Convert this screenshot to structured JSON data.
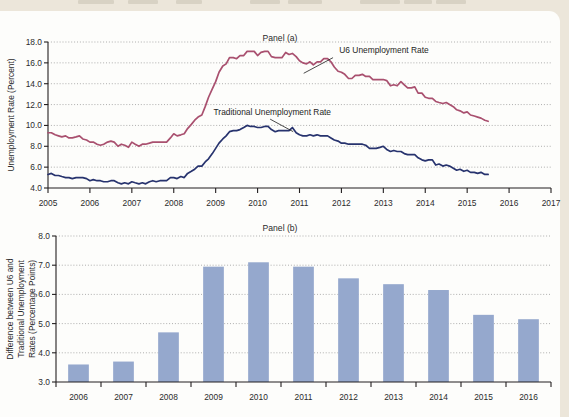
{
  "page": {
    "background_color": "#ece6da",
    "card_color": "#fdfdfb",
    "top_strip_ghost_text": "partial cut-off running-head text"
  },
  "figure": {
    "panel_a_title": "Panel (a)",
    "panel_b_title": "Panel (b)"
  },
  "chart_data": [
    {
      "id": "panel-a",
      "type": "line",
      "title": "Panel (a)",
      "xlabel": "",
      "ylabel": "Unemployment Rate (Percent)",
      "ylim": [
        4.0,
        18.0
      ],
      "ytick_values": [
        4.0,
        6.0,
        8.0,
        10.0,
        12.0,
        14.0,
        16.0,
        18.0
      ],
      "ytick_labels": [
        "4.0",
        "6.0",
        "8.0",
        "10.0",
        "12.0",
        "14.0",
        "16.0",
        "18.0"
      ],
      "xlim": [
        2005,
        2017
      ],
      "xtick_values": [
        2005,
        2006,
        2007,
        2008,
        2009,
        2010,
        2011,
        2012,
        2013,
        2014,
        2015,
        2016,
        2017
      ],
      "xtick_labels": [
        "2005",
        "2006",
        "2007",
        "2008",
        "2009",
        "2010",
        "2011",
        "2012",
        "2013",
        "2014",
        "2015",
        "2016",
        "2017"
      ],
      "grid": "horizontal-dotted",
      "legend": "inline-annotations",
      "annotations": [
        {
          "text": "U6 Unemployment Rate",
          "series": "u6"
        },
        {
          "text": "Traditional Unemployment Rate",
          "series": "traditional"
        }
      ],
      "series": [
        {
          "name": "U6 Unemployment Rate",
          "color": "#a9506f",
          "x": [
            2005.0,
            2005.08,
            2005.17,
            2005.25,
            2005.33,
            2005.42,
            2005.5,
            2005.58,
            2005.67,
            2005.75,
            2005.83,
            2005.92,
            2006.0,
            2006.08,
            2006.17,
            2006.25,
            2006.33,
            2006.42,
            2006.5,
            2006.58,
            2006.67,
            2006.75,
            2006.83,
            2006.92,
            2007.0,
            2007.08,
            2007.17,
            2007.25,
            2007.33,
            2007.42,
            2007.5,
            2007.58,
            2007.67,
            2007.75,
            2007.83,
            2007.92,
            2008.0,
            2008.08,
            2008.17,
            2008.25,
            2008.33,
            2008.42,
            2008.5,
            2008.58,
            2008.67,
            2008.75,
            2008.83,
            2008.92,
            2009.0,
            2009.08,
            2009.17,
            2009.25,
            2009.33,
            2009.42,
            2009.5,
            2009.58,
            2009.67,
            2009.75,
            2009.83,
            2009.92,
            2010.0,
            2010.08,
            2010.17,
            2010.25,
            2010.33,
            2010.42,
            2010.5,
            2010.58,
            2010.67,
            2010.75,
            2010.83,
            2010.92,
            2011.0,
            2011.08,
            2011.17,
            2011.25,
            2011.33,
            2011.42,
            2011.5,
            2011.58,
            2011.67,
            2011.75,
            2011.83,
            2011.92,
            2012.0,
            2012.08,
            2012.17,
            2012.25,
            2012.33,
            2012.42,
            2012.5,
            2012.58,
            2012.67,
            2012.75,
            2012.83,
            2012.92,
            2013.0,
            2013.08,
            2013.17,
            2013.25,
            2013.33,
            2013.42,
            2013.5,
            2013.58,
            2013.67,
            2013.75,
            2013.83,
            2013.92,
            2014.0,
            2014.08,
            2014.17,
            2014.25,
            2014.33,
            2014.42,
            2014.5,
            2014.58,
            2014.67,
            2014.75,
            2014.83,
            2014.92,
            2015.0,
            2015.08,
            2015.17,
            2015.25,
            2015.33,
            2015.42,
            2015.5
          ],
          "y": [
            9.3,
            9.3,
            9.1,
            9.0,
            8.9,
            9.0,
            8.8,
            8.8,
            8.9,
            9.0,
            8.7,
            8.6,
            8.4,
            8.4,
            8.2,
            8.1,
            8.2,
            8.4,
            8.5,
            8.4,
            8.0,
            8.2,
            8.1,
            7.9,
            8.4,
            8.2,
            8.0,
            8.2,
            8.2,
            8.3,
            8.4,
            8.4,
            8.4,
            8.4,
            8.4,
            8.8,
            9.2,
            9.0,
            9.1,
            9.2,
            9.7,
            10.1,
            10.5,
            10.8,
            11.0,
            11.8,
            12.7,
            13.5,
            14.2,
            15.1,
            15.7,
            15.9,
            16.5,
            16.5,
            16.4,
            16.7,
            16.7,
            17.1,
            17.1,
            17.1,
            16.7,
            17.0,
            17.1,
            17.1,
            16.6,
            16.5,
            16.5,
            16.5,
            17.0,
            16.8,
            16.9,
            16.6,
            16.2,
            16.0,
            15.9,
            16.1,
            15.8,
            16.1,
            16.1,
            16.4,
            16.4,
            16.1,
            15.6,
            15.2,
            15.1,
            14.9,
            14.5,
            14.5,
            14.8,
            14.8,
            14.9,
            14.7,
            14.7,
            14.4,
            14.4,
            14.4,
            14.4,
            14.3,
            13.8,
            13.9,
            13.8,
            14.2,
            13.9,
            13.6,
            13.6,
            13.7,
            13.1,
            13.1,
            12.7,
            12.6,
            12.6,
            12.3,
            12.2,
            12.1,
            12.2,
            12.0,
            11.8,
            11.5,
            11.4,
            11.2,
            11.3,
            11.0,
            10.9,
            10.8,
            10.7,
            10.5,
            10.4
          ]
        },
        {
          "name": "Traditional Unemployment Rate",
          "color": "#27336e",
          "x": [
            2005.0,
            2005.08,
            2005.17,
            2005.25,
            2005.33,
            2005.42,
            2005.5,
            2005.58,
            2005.67,
            2005.75,
            2005.83,
            2005.92,
            2006.0,
            2006.08,
            2006.17,
            2006.25,
            2006.33,
            2006.42,
            2006.5,
            2006.58,
            2006.67,
            2006.75,
            2006.83,
            2006.92,
            2007.0,
            2007.08,
            2007.17,
            2007.25,
            2007.33,
            2007.42,
            2007.5,
            2007.58,
            2007.67,
            2007.75,
            2007.83,
            2007.92,
            2008.0,
            2008.08,
            2008.17,
            2008.25,
            2008.33,
            2008.42,
            2008.5,
            2008.58,
            2008.67,
            2008.75,
            2008.83,
            2008.92,
            2009.0,
            2009.08,
            2009.17,
            2009.25,
            2009.33,
            2009.42,
            2009.5,
            2009.58,
            2009.67,
            2009.75,
            2009.83,
            2009.92,
            2010.0,
            2010.08,
            2010.17,
            2010.25,
            2010.33,
            2010.42,
            2010.5,
            2010.58,
            2010.67,
            2010.75,
            2010.83,
            2010.92,
            2011.0,
            2011.08,
            2011.17,
            2011.25,
            2011.33,
            2011.42,
            2011.5,
            2011.58,
            2011.67,
            2011.75,
            2011.83,
            2011.92,
            2012.0,
            2012.08,
            2012.17,
            2012.25,
            2012.33,
            2012.42,
            2012.5,
            2012.58,
            2012.67,
            2012.75,
            2012.83,
            2012.92,
            2013.0,
            2013.08,
            2013.17,
            2013.25,
            2013.33,
            2013.42,
            2013.5,
            2013.58,
            2013.67,
            2013.75,
            2013.83,
            2013.92,
            2014.0,
            2014.08,
            2014.17,
            2014.25,
            2014.33,
            2014.42,
            2014.5,
            2014.58,
            2014.67,
            2014.75,
            2014.83,
            2014.92,
            2015.0,
            2015.08,
            2015.17,
            2015.25,
            2015.33,
            2015.42,
            2015.5
          ],
          "y": [
            5.3,
            5.4,
            5.2,
            5.2,
            5.1,
            5.0,
            5.0,
            4.9,
            5.0,
            5.0,
            5.0,
            4.9,
            4.7,
            4.8,
            4.7,
            4.7,
            4.6,
            4.6,
            4.7,
            4.7,
            4.5,
            4.4,
            4.5,
            4.4,
            4.6,
            4.5,
            4.4,
            4.5,
            4.4,
            4.6,
            4.7,
            4.6,
            4.7,
            4.7,
            4.7,
            5.0,
            5.0,
            4.9,
            5.1,
            5.0,
            5.4,
            5.6,
            5.8,
            6.1,
            6.1,
            6.5,
            6.8,
            7.3,
            7.8,
            8.3,
            8.7,
            9.0,
            9.4,
            9.5,
            9.5,
            9.6,
            9.8,
            10.0,
            9.9,
            9.9,
            9.8,
            9.8,
            9.9,
            9.9,
            9.6,
            9.4,
            9.5,
            9.5,
            9.5,
            9.5,
            9.8,
            9.3,
            9.1,
            9.0,
            9.0,
            9.1,
            9.0,
            9.1,
            9.0,
            9.0,
            9.0,
            8.8,
            8.6,
            8.5,
            8.3,
            8.3,
            8.2,
            8.2,
            8.2,
            8.2,
            8.2,
            8.1,
            7.8,
            7.8,
            7.8,
            7.9,
            8.0,
            7.7,
            7.5,
            7.6,
            7.5,
            7.5,
            7.3,
            7.2,
            7.2,
            7.2,
            6.9,
            6.7,
            6.6,
            6.7,
            6.7,
            6.2,
            6.3,
            6.1,
            6.2,
            6.1,
            5.9,
            5.7,
            5.8,
            5.6,
            5.7,
            5.5,
            5.5,
            5.4,
            5.5,
            5.3,
            5.3
          ]
        }
      ]
    },
    {
      "id": "panel-b",
      "type": "bar",
      "title": "Panel (b)",
      "xlabel": "",
      "ylabel": "Difference between U6 and Traditional Unemployment Rates (Percentage Points)",
      "ylabel_lines": [
        "Difference between U6 and",
        "Traditional Unemployment",
        "Rates (Percentage Points)"
      ],
      "ylim": [
        3.0,
        8.0
      ],
      "ytick_values": [
        3.0,
        4.0,
        5.0,
        6.0,
        7.0,
        8.0
      ],
      "ytick_labels": [
        "3.0",
        "4.0",
        "5.0",
        "6.0",
        "7.0",
        "8.0"
      ],
      "grid": "horizontal-dotted",
      "bar_color": "#95a8cd",
      "categories": [
        "2006",
        "2007",
        "2008",
        "2009",
        "2010",
        "2011",
        "2012",
        "2013",
        "2014",
        "2015",
        "2016"
      ],
      "values": [
        3.6,
        3.7,
        4.7,
        6.95,
        7.1,
        6.95,
        6.55,
        6.35,
        6.15,
        5.3,
        5.15
      ]
    }
  ]
}
